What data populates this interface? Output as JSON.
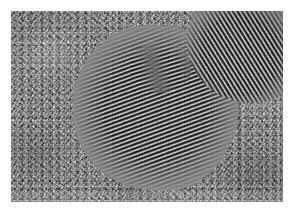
{
  "figure": {
    "kind": "hrtem-micrograph",
    "caption": "",
    "alt_text": "High-resolution transmission electron micrograph of crystalline nanoparticles showing lattice fringes embedded in an amorphous support film",
    "width_px": 293,
    "height_px": 214,
    "colors": {
      "paper": "#ffffff",
      "film_mid_gray": "#8f8f8f",
      "fringe_dark": "#151515",
      "fringe_light": "#d2d2d2"
    }
  },
  "plate": {
    "name": "micrograph-plate",
    "left_px": 11,
    "top_px": 11,
    "width_px": 272,
    "height_px": 191,
    "rendering": "grayscale"
  },
  "regions": {
    "background": {
      "label": "amorphous support film",
      "texture": "granular speckle"
    },
    "grains": [
      {
        "id": "grain-main",
        "label": "main crystalline nanoparticle",
        "fringe_angle_deg": -20,
        "fringe_spacing_px": 3.9,
        "center_px": [
          145,
          97
        ],
        "diameter_px": 166
      },
      {
        "id": "grain-corner",
        "label": "upper-right crystalline nanoparticle",
        "fringe_angle_deg": 58,
        "fringe_spacing_px": 3.9,
        "center_px": [
          239,
          29
        ],
        "diameter_px": 126
      },
      {
        "id": "grain-subdomain",
        "label": "interior sub-domain",
        "fringe_angle_deg": -14,
        "fringe_spacing_px": 3.9,
        "center_px": [
          149,
          56
        ],
        "diameter_px": 62
      }
    ]
  },
  "annotations": {
    "scale_bar": null,
    "labels": [],
    "overlay_text": []
  }
}
